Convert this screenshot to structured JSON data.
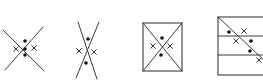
{
  "figure": {
    "type": "geometry-diagram",
    "colors": {
      "ink": "#333333",
      "background": "#ffffff"
    },
    "panels": [
      {
        "id": "fig1",
        "kind": "two-crossing-lines",
        "lines": [
          [
            3,
            30,
            44,
            71
          ],
          [
            43,
            27,
            5,
            70
          ]
        ],
        "dots": [
          [
            25,
            41
          ],
          [
            25,
            49
          ],
          [
            25,
            55
          ]
        ],
        "crosses": [
          [
            16,
            49
          ],
          [
            34,
            48
          ]
        ]
      },
      {
        "id": "fig2",
        "kind": "two-steep-crossing-lines",
        "lines": [
          [
            78,
            22,
            97,
            79
          ],
          [
            99,
            22,
            76,
            78
          ]
        ],
        "dots": [
          [
            88,
            39
          ],
          [
            86,
            63
          ]
        ],
        "crosses": [
          [
            79,
            51
          ],
          [
            94,
            52
          ]
        ]
      },
      {
        "id": "fig3",
        "kind": "rectangle-with-diagonals",
        "rect": [
          143,
          23,
          39,
          48
        ],
        "lines": [
          [
            143,
            23,
            182,
            71
          ],
          [
            182,
            23,
            143,
            71
          ]
        ],
        "dots": [
          [
            162,
            38
          ],
          [
            161,
            55
          ]
        ],
        "crosses": [
          [
            153,
            46
          ],
          [
            170,
            46
          ]
        ]
      },
      {
        "id": "fig4",
        "kind": "striped-box-with-diagonal",
        "rect": [
          218,
          17,
          50,
          58
        ],
        "lines": [
          [
            218,
            36,
            268,
            36
          ],
          [
            218,
            55,
            268,
            55
          ],
          [
            218,
            17,
            268,
            64
          ]
        ],
        "dots": [
          [
            229,
            32
          ],
          [
            251,
            41
          ],
          [
            250,
            51
          ]
        ],
        "crosses": [
          [
            244,
            31
          ],
          [
            236,
            41
          ],
          [
            259,
            60
          ]
        ]
      }
    ]
  }
}
